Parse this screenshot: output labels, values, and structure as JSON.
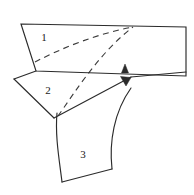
{
  "figure": {
    "background_color": "#ffffff",
    "stroke_color": "#2b2b2b",
    "dash_color": "#3a3a3a",
    "label_color": "#1a1a1a",
    "width": 194,
    "height": 195
  },
  "regions": [
    {
      "id": "region-1",
      "label": "1",
      "label_x": 44,
      "label_y": 38,
      "shape": "quadrilateral",
      "outline": "M21,24 L186,27 L186,76 L36,71 Z"
    },
    {
      "id": "region-2",
      "label": "2",
      "label_x": 48,
      "label_y": 91,
      "shape": "quadrilateral",
      "outline": "M36,71 L14,79 L54,118 L128,79 Z"
    },
    {
      "id": "region-3",
      "label": "3",
      "label_x": 83,
      "label_y": 155,
      "shape": "curved-band",
      "outline": "M57,113 C55,135 59,158 62,182 L112,169 C109,142 114,112 131,88"
    }
  ],
  "edges": [
    {
      "id": "region-1-top-edge",
      "path": "M21,24 L186,27"
    },
    {
      "id": "region-1-left-edge",
      "path": "M21,24 L36,71"
    },
    {
      "id": "region-1-right-edge",
      "path": "M186,27 L186,76"
    },
    {
      "id": "region-1-bottom-edge",
      "path": "M36,71 L186,76"
    },
    {
      "id": "region-2-upper-left-edge",
      "path": "M36,71 L14,79"
    },
    {
      "id": "region-2-lower-left-edge",
      "path": "M14,79 L54,118"
    },
    {
      "id": "region-2-fold-edge",
      "path": "M54,118 L131,77"
    },
    {
      "id": "region-2-right-flap-edge",
      "path": "M131,77 L186,72"
    },
    {
      "id": "region-3-left-curve",
      "path": "M57,113 C55,135 59,158 62,182"
    },
    {
      "id": "region-3-bottom-edge",
      "path": "M62,182 L112,169"
    },
    {
      "id": "region-3-right-curve",
      "path": "M112,169 C109,142 114,112 131,88"
    },
    {
      "id": "region-3-top-joint",
      "path": "M57,113 L62,110"
    }
  ],
  "dashed_curves": [
    {
      "id": "dashed-curve-upper",
      "path": "M35,62 C62,48 96,34 133,27"
    },
    {
      "id": "dashed-curve-lower",
      "path": "M58,116 C75,92 100,52 133,27"
    }
  ],
  "arrows": [
    {
      "id": "arrow-up",
      "points": "125,64 121,73 129,73",
      "direction": "up",
      "tip_x": 125,
      "tip_y": 64
    },
    {
      "id": "arrow-down",
      "points": "126,86 121,76 131,77",
      "direction": "down",
      "tip_x": 126,
      "tip_y": 86
    }
  ]
}
